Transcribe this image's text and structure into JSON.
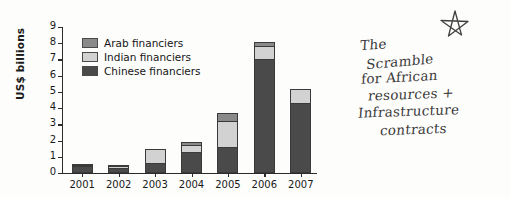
{
  "chart_data": {
    "type": "bar",
    "subtype": "stacked",
    "title": "",
    "xlabel": "",
    "ylabel": "US$ billions",
    "categories": [
      "2001",
      "2002",
      "2003",
      "2004",
      "2005",
      "2006",
      "2007"
    ],
    "ylim": [
      0,
      9
    ],
    "yticks": [
      0,
      1,
      2,
      3,
      4,
      5,
      6,
      7,
      8,
      9
    ],
    "ytick_labels": [
      "0",
      "1",
      "2",
      "3",
      "4",
      "5",
      "6",
      "7",
      "8",
      "9"
    ],
    "grid": false,
    "legend_position": "upper-left-inside",
    "series": [
      {
        "name": "Chinese financiers",
        "color": "#4a4a4a",
        "values": [
          0.45,
          0.3,
          0.6,
          1.3,
          1.6,
          7.0,
          4.3
        ]
      },
      {
        "name": "Indian financiers",
        "color": "#d2d2d2",
        "values": [
          0.1,
          0.2,
          0.9,
          0.5,
          1.65,
          0.9,
          0.9
        ]
      },
      {
        "name": "Arab financiers",
        "color": "#8a8a8a",
        "values": [
          0.1,
          0.1,
          0.0,
          0.2,
          0.55,
          0.25,
          0.0
        ]
      }
    ],
    "totals": [
      0.65,
      0.6,
      1.5,
      2.0,
      3.8,
      8.15,
      5.2
    ]
  },
  "legend": {
    "items": [
      {
        "label": "Arab financiers",
        "color": "#8a8a8a"
      },
      {
        "label": "Indian financiers",
        "color": "#d2d2d2"
      },
      {
        "label": "Chinese financiers",
        "color": "#4a4a4a"
      }
    ]
  },
  "annotation": {
    "icon": "star-icon",
    "lines": [
      "The",
      "Scramble",
      "for African",
      "resources +",
      "Infrastructure",
      "contracts"
    ],
    "full_text": "The Scramble for African resources + Infrastructure contracts",
    "ink_color": "#3a3a3a"
  },
  "colors": {
    "axis": "#2b2b2b",
    "text": "#1a1a1a",
    "background": "#fdfdfc"
  }
}
